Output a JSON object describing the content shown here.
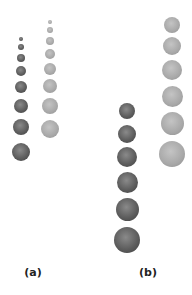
{
  "labels": {
    "a": "(a)",
    "b": "(b)"
  },
  "panels": [
    {
      "id": "a",
      "label_pos": {
        "x": 33,
        "y": 266
      },
      "columns": [
        {
          "tone": "dark",
          "x": 21,
          "circles": [
            {
              "y": 39,
              "r": 2.2
            },
            {
              "y": 47,
              "r": 3
            },
            {
              "y": 58,
              "r": 4
            },
            {
              "y": 71,
              "r": 5
            },
            {
              "y": 87,
              "r": 6
            },
            {
              "y": 106,
              "r": 7
            },
            {
              "y": 127,
              "r": 8
            },
            {
              "y": 152,
              "r": 9
            }
          ]
        },
        {
          "tone": "light",
          "x": 50,
          "circles": [
            {
              "y": 22,
              "r": 2.2
            },
            {
              "y": 30,
              "r": 3
            },
            {
              "y": 41,
              "r": 4
            },
            {
              "y": 54,
              "r": 5
            },
            {
              "y": 69,
              "r": 6
            },
            {
              "y": 86,
              "r": 7
            },
            {
              "y": 106,
              "r": 8
            },
            {
              "y": 129,
              "r": 9
            }
          ]
        }
      ]
    },
    {
      "id": "b",
      "label_pos": {
        "x": 148,
        "y": 266
      },
      "columns": [
        {
          "tone": "dark",
          "x": 127,
          "circles": [
            {
              "y": 111,
              "r": 8
            },
            {
              "y": 134,
              "r": 9
            },
            {
              "y": 157,
              "r": 10
            },
            {
              "y": 182,
              "r": 10.5
            },
            {
              "y": 209,
              "r": 11.5
            },
            {
              "y": 240,
              "r": 13
            }
          ]
        },
        {
          "tone": "light",
          "x": 172,
          "circles": [
            {
              "y": 25,
              "r": 8
            },
            {
              "y": 46,
              "r": 9
            },
            {
              "y": 70,
              "r": 10
            },
            {
              "y": 96,
              "r": 10.5
            },
            {
              "y": 123,
              "r": 11.5
            },
            {
              "y": 154,
              "r": 13
            }
          ]
        }
      ]
    }
  ]
}
